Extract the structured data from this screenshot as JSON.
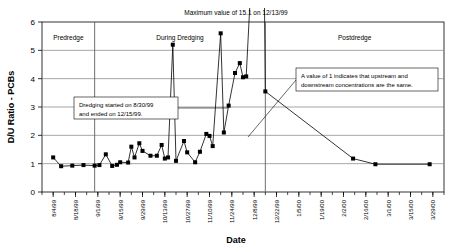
{
  "chart_data": {
    "type": "line",
    "title": "Maximum value of 15.1 on 12/13/99",
    "xlabel": "Date",
    "ylabel": "D/U Ratio - PCBs",
    "ylim": [
      0,
      6
    ],
    "yticks": [
      0,
      1,
      2,
      3,
      4,
      5,
      6
    ],
    "grid": true,
    "legend": "none",
    "xlim": [
      "7/28/99",
      "4/5/00"
    ],
    "xticks": [
      "8/4/99",
      "8/18/99",
      "9/1/99",
      "9/15/99",
      "9/29/99",
      "10/13/99",
      "10/27/99",
      "11/10/99",
      "11/24/99",
      "12/8/99",
      "12/22/99",
      "1/5/00",
      "1/19/00",
      "2/2/00",
      "2/16/00",
      "3/1/00",
      "3/15/00",
      "3/29/00"
    ],
    "series": [
      {
        "name": "D/U Ratio - PCBs",
        "marker": "square",
        "color": "#000000",
        "points": [
          {
            "x": "8/4/99",
            "y": 1.22
          },
          {
            "x": "8/9/99",
            "y": 0.91
          },
          {
            "x": "8/16/99",
            "y": 0.93
          },
          {
            "x": "8/23/99",
            "y": 0.95
          },
          {
            "x": "8/30/99",
            "y": 0.93
          },
          {
            "x": "9/2/99",
            "y": 0.95
          },
          {
            "x": "9/6/99",
            "y": 1.33
          },
          {
            "x": "9/10/99",
            "y": 0.92
          },
          {
            "x": "9/13/99",
            "y": 0.96
          },
          {
            "x": "9/15/99",
            "y": 1.05
          },
          {
            "x": "9/20/99",
            "y": 1.04
          },
          {
            "x": "9/22/99",
            "y": 1.6
          },
          {
            "x": "9/24/99",
            "y": 1.22
          },
          {
            "x": "9/27/99",
            "y": 1.72
          },
          {
            "x": "9/29/99",
            "y": 1.45
          },
          {
            "x": "10/4/99",
            "y": 1.28
          },
          {
            "x": "10/8/99",
            "y": 1.28
          },
          {
            "x": "10/11/99",
            "y": 1.66
          },
          {
            "x": "10/13/99",
            "y": 1.18
          },
          {
            "x": "10/15/99",
            "y": 1.22
          },
          {
            "x": "10/18/99",
            "y": 5.2
          },
          {
            "x": "10/20/99",
            "y": 1.1
          },
          {
            "x": "10/25/99",
            "y": 1.8
          },
          {
            "x": "10/27/99",
            "y": 1.4
          },
          {
            "x": "11/1/99",
            "y": 1.05
          },
          {
            "x": "11/4/99",
            "y": 1.42
          },
          {
            "x": "11/8/99",
            "y": 2.05
          },
          {
            "x": "11/10/99",
            "y": 1.98
          },
          {
            "x": "11/12/99",
            "y": 1.62
          },
          {
            "x": "11/17/99",
            "y": 5.6
          },
          {
            "x": "11/19/99",
            "y": 2.1
          },
          {
            "x": "11/22/99",
            "y": 3.05
          },
          {
            "x": "11/26/99",
            "y": 4.2
          },
          {
            "x": "11/29/99",
            "y": 4.55
          },
          {
            "x": "12/1/99",
            "y": 4.05
          },
          {
            "x": "12/3/99",
            "y": 4.08
          },
          {
            "x": "12/13/99",
            "y": 15.1
          },
          {
            "x": "12/15/99",
            "y": 3.55
          },
          {
            "x": "2/8/00",
            "y": 1.18
          },
          {
            "x": "2/22/00",
            "y": 0.98
          },
          {
            "x": "3/27/00",
            "y": 0.98
          }
        ]
      }
    ],
    "bands": [
      {
        "label": "Predredge",
        "start": "7/28/99",
        "end": "8/30/99"
      },
      {
        "label": "During Dredging",
        "start": "8/30/99",
        "end": "12/15/99"
      },
      {
        "label": "Postdredge",
        "start": "12/15/99",
        "end": "4/5/00"
      }
    ],
    "annotations": [
      {
        "name": "dredging-dates-note",
        "text": "Dredging started on 8/30/99 and ended on 12/15/99."
      },
      {
        "name": "ratio-meaning-note",
        "text": "A value of 1 indicates that  upstream and downstream concentrations are the same."
      }
    ]
  }
}
